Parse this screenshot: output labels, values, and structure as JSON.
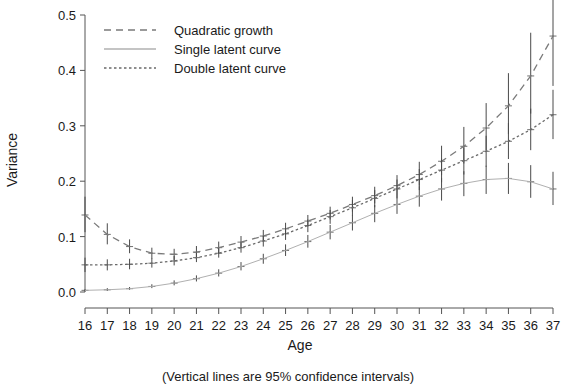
{
  "axes": {
    "y_title": "Variance",
    "x_title": "Age",
    "y_ticks": [
      "0.0",
      "0.1",
      "0.2",
      "0.3",
      "0.4",
      "0.5"
    ],
    "x_ticks": [
      "16",
      "17",
      "18",
      "19",
      "20",
      "21",
      "22",
      "23",
      "24",
      "25",
      "26",
      "27",
      "28",
      "29",
      "30",
      "31",
      "32",
      "33",
      "34",
      "35",
      "36",
      "37"
    ]
  },
  "caption": "(Vertical lines are 95% confidence intervals)",
  "legend": {
    "items": [
      {
        "label": "Quadratic growth",
        "style": "dashed",
        "color": "#7a7a7a"
      },
      {
        "label": "Single latent curve",
        "style": "solid",
        "color": "#b0b0b0"
      },
      {
        "label": "Double latent curve",
        "style": "dotted",
        "color": "#6a6a6a"
      }
    ]
  },
  "chart_data": {
    "type": "line",
    "title": "",
    "xlabel": "Age",
    "ylabel": "Variance",
    "xlim": [
      16,
      37
    ],
    "ylim": [
      0.0,
      0.5
    ],
    "grid": false,
    "legend_position": "top-left",
    "annotation": "(Vertical lines are 95% confidence intervals)",
    "x": [
      16,
      17,
      18,
      19,
      20,
      21,
      22,
      23,
      24,
      25,
      26,
      27,
      28,
      29,
      30,
      31,
      32,
      33,
      34,
      35,
      36,
      37
    ],
    "series": [
      {
        "name": "Quadratic growth",
        "style": "dashed",
        "color": "#7a7a7a",
        "values": [
          0.139,
          0.104,
          0.082,
          0.07,
          0.068,
          0.072,
          0.08,
          0.09,
          0.101,
          0.114,
          0.128,
          0.142,
          0.158,
          0.174,
          0.192,
          0.212,
          0.236,
          0.263,
          0.296,
          0.336,
          0.39,
          0.462
        ],
        "ci_lower": [
          0.108,
          0.086,
          0.07,
          0.06,
          0.058,
          0.062,
          0.07,
          0.08,
          0.091,
          0.104,
          0.118,
          0.131,
          0.145,
          0.16,
          0.175,
          0.192,
          0.211,
          0.232,
          0.256,
          0.285,
          0.322,
          0.372
        ],
        "ci_upper": [
          0.172,
          0.124,
          0.095,
          0.08,
          0.078,
          0.083,
          0.091,
          0.101,
          0.112,
          0.125,
          0.139,
          0.154,
          0.172,
          0.19,
          0.211,
          0.235,
          0.264,
          0.298,
          0.341,
          0.395,
          0.468,
          0.56
        ]
      },
      {
        "name": "Single latent curve",
        "style": "solid",
        "color": "#b0b0b0",
        "values": [
          0.003,
          0.004,
          0.006,
          0.01,
          0.016,
          0.024,
          0.034,
          0.046,
          0.06,
          0.075,
          0.091,
          0.108,
          0.125,
          0.142,
          0.158,
          0.173,
          0.186,
          0.196,
          0.203,
          0.205,
          0.199,
          0.186
        ],
        "ci_lower": [
          0.001,
          0.002,
          0.004,
          0.007,
          0.012,
          0.019,
          0.028,
          0.039,
          0.051,
          0.065,
          0.08,
          0.095,
          0.111,
          0.126,
          0.141,
          0.154,
          0.165,
          0.173,
          0.177,
          0.177,
          0.17,
          0.157
        ],
        "ci_upper": [
          0.005,
          0.007,
          0.009,
          0.014,
          0.021,
          0.03,
          0.041,
          0.054,
          0.069,
          0.086,
          0.103,
          0.121,
          0.139,
          0.157,
          0.175,
          0.191,
          0.206,
          0.218,
          0.228,
          0.233,
          0.229,
          0.217
        ]
      },
      {
        "name": "Double latent curve",
        "style": "dotted",
        "color": "#6a6a6a",
        "values": [
          0.049,
          0.049,
          0.05,
          0.052,
          0.056,
          0.062,
          0.07,
          0.08,
          0.092,
          0.105,
          0.12,
          0.136,
          0.152,
          0.169,
          0.186,
          0.203,
          0.22,
          0.237,
          0.254,
          0.272,
          0.293,
          0.32
        ],
        "ci_lower": [
          0.036,
          0.039,
          0.041,
          0.044,
          0.048,
          0.054,
          0.062,
          0.071,
          0.082,
          0.094,
          0.108,
          0.123,
          0.138,
          0.153,
          0.169,
          0.184,
          0.198,
          0.212,
          0.226,
          0.24,
          0.256,
          0.276
        ],
        "ci_upper": [
          0.062,
          0.059,
          0.06,
          0.061,
          0.065,
          0.071,
          0.079,
          0.089,
          0.101,
          0.115,
          0.131,
          0.148,
          0.166,
          0.184,
          0.203,
          0.222,
          0.241,
          0.261,
          0.282,
          0.305,
          0.331,
          0.365
        ]
      }
    ]
  }
}
